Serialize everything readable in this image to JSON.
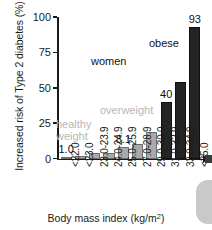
{
  "chart_data": {
    "type": "bar",
    "title": "",
    "xlabel": "Body mass index (kg/m2)",
    "xlabel_base": "Body mass index (kg/m",
    "xlabel_sup": "2",
    "xlabel_tail": ")",
    "ylabel": "Increased risk of Type 2 diabetes (%)",
    "ylim": [
      0,
      100
    ],
    "yticks": [
      0,
      25,
      50,
      75,
      100
    ],
    "ytick_labels": [
      "0",
      "25",
      "50",
      "75",
      "100"
    ],
    "grid": false,
    "legend": "none",
    "categories": [
      "<22.0",
      "<23.0",
      "23.0-23.9",
      "24.0-24.9",
      "25.0-25.9",
      "27.0-28.9",
      "29.0-30.0",
      "31.0-32.9",
      "33.0-34.9",
      "<35.0"
    ],
    "values": [
      1.0,
      2.0,
      4.0,
      4.0,
      8.1,
      10.5,
      18.5,
      40,
      54,
      93
    ],
    "bar_colors": [
      "#a9a9a9",
      "#a9a9a9",
      "#a9a9a9",
      "#a9a9a9",
      "#a9a9a9",
      "#a9a9a9",
      "#a9a9a9",
      "#242424",
      "#242424",
      "#242424"
    ],
    "bar_labels": [
      {
        "index": 0,
        "text": "1.0"
      },
      {
        "index": 4,
        "text": "8.1"
      },
      {
        "index": 7,
        "text": "40"
      },
      {
        "index": 9,
        "text": "93"
      }
    ],
    "annotations": [
      {
        "name": "healthy-weight",
        "text_line1": "healthy",
        "text_line2": "weight",
        "color": "#b7b7b7"
      },
      {
        "name": "overweight",
        "text_line1": "overweight",
        "text_line2": "",
        "color": "#b7b7b7"
      },
      {
        "name": "women",
        "text_line1": "women",
        "text_line2": "",
        "color": "#111111"
      },
      {
        "name": "obese",
        "text_line1": "obese",
        "text_line2": "",
        "color": "#111111"
      }
    ],
    "colors": {
      "light_bar": "#a9a9a9",
      "dark_bar": "#242424",
      "axis": "#1a1a1a",
      "grey_text": "#b7b7b7",
      "black_text": "#111111",
      "background": "#ffffff"
    }
  }
}
